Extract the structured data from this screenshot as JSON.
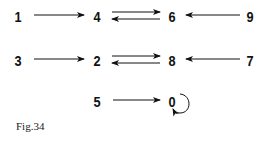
{
  "diagram": {
    "nodes": [
      {
        "id": "n1",
        "label": "1",
        "x": 18,
        "y": 16
      },
      {
        "id": "n4",
        "label": "4",
        "x": 97,
        "y": 16
      },
      {
        "id": "n6",
        "label": "6",
        "x": 172,
        "y": 16
      },
      {
        "id": "n9",
        "label": "9",
        "x": 250,
        "y": 16
      },
      {
        "id": "n3",
        "label": "3",
        "x": 18,
        "y": 60
      },
      {
        "id": "n2",
        "label": "2",
        "x": 97,
        "y": 60
      },
      {
        "id": "n8",
        "label": "8",
        "x": 172,
        "y": 60
      },
      {
        "id": "n7",
        "label": "7",
        "x": 250,
        "y": 60
      },
      {
        "id": "n5",
        "label": "5",
        "x": 97,
        "y": 101
      },
      {
        "id": "n0",
        "label": "0",
        "x": 172,
        "y": 101
      }
    ],
    "edges": [
      {
        "from": "1",
        "to": "4"
      },
      {
        "from": "4",
        "to": "6"
      },
      {
        "from": "6",
        "to": "4"
      },
      {
        "from": "9",
        "to": "6"
      },
      {
        "from": "3",
        "to": "2"
      },
      {
        "from": "2",
        "to": "8"
      },
      {
        "from": "8",
        "to": "2"
      },
      {
        "from": "7",
        "to": "8"
      },
      {
        "from": "5",
        "to": "0"
      },
      {
        "from": "0",
        "to": "0"
      }
    ],
    "caption": "Fig.34"
  }
}
